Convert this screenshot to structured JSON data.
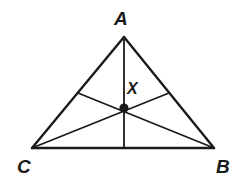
{
  "figure": {
    "kind": "geometry-diagram",
    "width": 245,
    "height": 183,
    "background_color": "#ffffff",
    "stroke_color": "#1a1a1a",
    "label_color": "#1a1a1a",
    "stroke_width": 2.4,
    "thin_stroke_width": 1.8,
    "point_radius": 4.6
  },
  "labels": {
    "apex": "A",
    "bottom_left": "C",
    "bottom_right": "B",
    "interior_point": "X"
  },
  "points": {
    "A": {
      "x": 124,
      "y": 37
    },
    "B": {
      "x": 214,
      "y": 148
    },
    "C": {
      "x": 32,
      "y": 148
    },
    "X": {
      "x": 124,
      "y": 108
    },
    "midpoint_AC": {
      "x": 78,
      "y": 93
    },
    "midpoint_AB": {
      "x": 169,
      "y": 93
    },
    "midpoint_CB": {
      "x": 124,
      "y": 148
    }
  },
  "segments": [
    {
      "name": "side-AC",
      "from": "A",
      "to": "C",
      "weight": "thick"
    },
    {
      "name": "side-AB",
      "from": "A",
      "to": "B",
      "weight": "thick"
    },
    {
      "name": "side-CB",
      "from": "C",
      "to": "B",
      "weight": "thick"
    },
    {
      "name": "median-A-to-CB",
      "from": "A",
      "to": "midpoint_CB",
      "weight": "thin"
    },
    {
      "name": "median-B-to-AC",
      "from": "B",
      "to": "midpoint_AC",
      "weight": "thin"
    },
    {
      "name": "median-C-to-AB",
      "from": "C",
      "to": "midpoint_AB",
      "weight": "thin"
    }
  ],
  "label_positions": {
    "A": {
      "left": 114,
      "top": 9
    },
    "C": {
      "left": 17,
      "top": 157
    },
    "B": {
      "left": 216,
      "top": 157
    },
    "X": {
      "left": 127,
      "top": 81
    }
  }
}
